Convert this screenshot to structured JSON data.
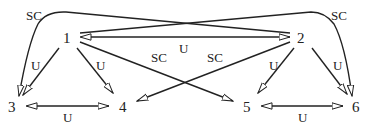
{
  "diagram": {
    "type": "directed-graph",
    "nodes": [
      {
        "id": "1",
        "label": "1",
        "x": 68,
        "y": 43
      },
      {
        "id": "2",
        "label": "2",
        "x": 302,
        "y": 43
      },
      {
        "id": "3",
        "label": "3",
        "x": 12,
        "y": 112
      },
      {
        "id": "4",
        "label": "4",
        "x": 124,
        "y": 112
      },
      {
        "id": "5",
        "label": "5",
        "x": 248,
        "y": 112
      },
      {
        "id": "6",
        "label": "6",
        "x": 358,
        "y": 112
      }
    ],
    "edges": [
      {
        "from": "2",
        "to": "3",
        "label": "SC",
        "style": "curved"
      },
      {
        "from": "1",
        "to": "6",
        "label": "SC",
        "style": "curved"
      },
      {
        "from": "1",
        "to": "2",
        "label": "U",
        "bidirectional": true
      },
      {
        "from": "1",
        "to": "3",
        "label": "U"
      },
      {
        "from": "1",
        "to": "4",
        "label": "U"
      },
      {
        "from": "1",
        "to": "5",
        "label": "SC"
      },
      {
        "from": "2",
        "to": "4",
        "label": "SC"
      },
      {
        "from": "2",
        "to": "5",
        "label": "U"
      },
      {
        "from": "2",
        "to": "6",
        "label": "U"
      },
      {
        "from": "3",
        "to": "4",
        "label": "U",
        "bidirectional": true
      },
      {
        "from": "5",
        "to": "6",
        "label": "U",
        "bidirectional": true
      }
    ],
    "labels": {
      "n1": "1",
      "n2": "2",
      "n3": "3",
      "n4": "4",
      "n5": "5",
      "n6": "6",
      "e_2_3": "SC",
      "e_1_6": "SC",
      "e_1_2": "U",
      "e_1_3": "U",
      "e_1_4": "U",
      "e_1_5": "SC",
      "e_2_4": "SC",
      "e_2_5": "U",
      "e_2_6": "U",
      "e_3_4": "U",
      "e_5_6": "U"
    }
  }
}
